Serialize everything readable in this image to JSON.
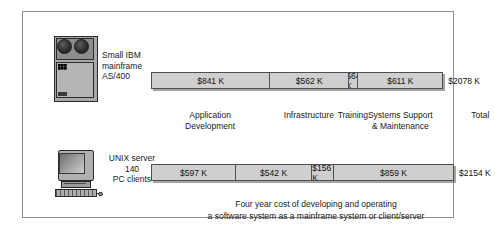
{
  "figure": {
    "caption": "Four year cost of developing and operating\na software system as a mainframe system or client/server"
  },
  "rows": [
    {
      "id": "mainframe",
      "label": "Small IBM\nmainframe\nAS/400",
      "icon": "mainframe-icon",
      "total": "$2078 K"
    },
    {
      "id": "unix",
      "label": "UNIX server\n140\nPC clients",
      "icon": "pc-workstation-icon",
      "total": "$2154 K"
    }
  ],
  "headers": [
    {
      "label": "Application\nDevelopment"
    },
    {
      "label": "Infrastructure"
    },
    {
      "label": "Training"
    },
    {
      "label": "Systems Support\n& Maintenance"
    },
    {
      "label": "Total"
    }
  ],
  "chart_data": {
    "type": "bar",
    "title": "Four year cost of developing and operating a software system as a mainframe system or client/server",
    "orientation": "horizontal-stacked",
    "categories": [
      "Application Development",
      "Infrastructure",
      "Training",
      "Systems Support & Maintenance"
    ],
    "unit": "$ thousands",
    "series": [
      {
        "name": "Small IBM mainframe AS/400",
        "values": [
          841,
          562,
          64,
          611
        ],
        "labels": [
          "$841 K",
          "$562 K",
          "$64 K",
          "$611 K"
        ],
        "total": 2078,
        "total_label": "$2078 K"
      },
      {
        "name": "UNIX server 140 PC clients",
        "values": [
          597,
          542,
          156,
          859
        ],
        "labels": [
          "$597 K",
          "$542 K",
          "$156 K",
          "$859 K"
        ],
        "total": 2154,
        "total_label": "$2154 K"
      }
    ],
    "xlabel": "",
    "ylabel": "",
    "grid": false,
    "legend": "none",
    "colors": {
      "bar_fill": "#cfcfcf",
      "bar_border": "#4f4f4f",
      "frame_border": "#8e8e8e",
      "text": "#1a1a1a",
      "background": "#ffffff"
    }
  }
}
